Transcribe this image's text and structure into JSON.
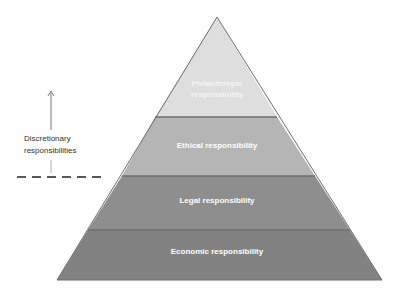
{
  "diagram": {
    "type": "pyramid",
    "levels": [
      {
        "label": "Philanthropic responsibility",
        "line1": "Philanthropic",
        "line2": "responsibility",
        "color": "#dcdcdc"
      },
      {
        "label": "Ethical responsibility",
        "color": "#b4b4b4"
      },
      {
        "label": "Legal responsibility",
        "color": "#8c8c8c"
      },
      {
        "label": "Economic responsibility",
        "color": "#828282"
      }
    ],
    "side_annotation": {
      "line1": "Discretionary",
      "line2": "responsibilities",
      "arrow": "up-arrow",
      "divider": "dashed-line"
    }
  }
}
